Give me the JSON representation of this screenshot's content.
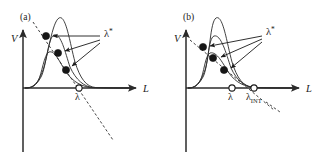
{
  "figure": {
    "background": "#ffffff",
    "ink_color": "#2b2b2b",
    "width": 326,
    "height": 159
  },
  "panels": [
    {
      "id": "a",
      "label": "(a)",
      "axes": {
        "y_label": "V",
        "x_label": "L",
        "origin_x": 23,
        "origin_y": 88,
        "x_axis_end": 140,
        "y_axis_top": 28,
        "y_axis_bottom": 152
      },
      "curves": [
        {
          "name": "curve-tall",
          "peak_x": 59,
          "peak_y": 18,
          "width": 17
        },
        {
          "name": "curve-medium",
          "peak_x": 53,
          "peak_y": 35,
          "width": 20
        },
        {
          "name": "curve-short",
          "peak_x": 48,
          "peak_y": 52,
          "width": 24
        }
      ],
      "critical_points": [
        {
          "name": "lambda-star-1",
          "x": 46,
          "y": 36,
          "type": "filled"
        },
        {
          "name": "lambda-star-2",
          "x": 58,
          "y": 53,
          "type": "filled"
        },
        {
          "name": "lambda-star-3",
          "x": 66,
          "y": 70,
          "type": "filled"
        }
      ],
      "axis_points": [
        {
          "name": "lambda",
          "label": "λ",
          "x": 79,
          "y": 88,
          "type": "open"
        }
      ],
      "dashed_line": {
        "name": "locus-line",
        "x1": 33,
        "y1": 22,
        "x2": 113,
        "y2": 140
      },
      "annotation": {
        "name": "lambda-star-annotation",
        "text": "λ",
        "superscript": "*",
        "x": 106,
        "y": 36,
        "arrows": [
          {
            "x1": 100,
            "y1": 36,
            "x2": 52,
            "y2": 36
          },
          {
            "x1": 100,
            "y1": 39,
            "x2": 64,
            "y2": 52
          },
          {
            "x1": 100,
            "y1": 41,
            "x2": 71,
            "y2": 67
          }
        ]
      }
    },
    {
      "id": "b",
      "label": "(b)",
      "axes": {
        "y_label": "V",
        "x_label": "L",
        "origin_x": 186,
        "origin_y": 88,
        "x_axis_end": 303,
        "y_axis_top": 28,
        "y_axis_bottom": 152
      },
      "curves": [
        {
          "name": "curve-tall",
          "peak_x": 216,
          "peak_y": 18,
          "width": 16
        },
        {
          "name": "curve-medium",
          "peak_x": 213,
          "peak_y": 36,
          "width": 20
        },
        {
          "name": "curve-short",
          "peak_x": 210,
          "peak_y": 53,
          "width": 24
        }
      ],
      "critical_points": [
        {
          "name": "lambda-star-1",
          "x": 203,
          "y": 47,
          "type": "filled"
        },
        {
          "name": "lambda-star-2",
          "x": 213,
          "y": 58,
          "type": "filled"
        },
        {
          "name": "lambda-star-3",
          "x": 224,
          "y": 70,
          "type": "filled"
        }
      ],
      "axis_points": [
        {
          "name": "lambda",
          "label": "λ",
          "x": 232,
          "y": 88,
          "type": "open"
        },
        {
          "name": "lambda-int",
          "label": "λ",
          "subscript": "INT",
          "x": 254,
          "y": 88,
          "type": "open"
        }
      ],
      "dashed_line": {
        "name": "locus-line",
        "x1": 190,
        "y1": 40,
        "x2": 272,
        "y2": 108
      },
      "annotation": {
        "name": "lambda-star-annotation",
        "text": "λ",
        "superscript": "*",
        "x": 268,
        "y": 34,
        "arrows": [
          {
            "x1": 262,
            "y1": 36,
            "x2": 209,
            "y2": 46
          },
          {
            "x1": 262,
            "y1": 39,
            "x2": 220,
            "y2": 57
          },
          {
            "x1": 262,
            "y1": 41,
            "x2": 230,
            "y2": 68
          }
        ]
      }
    }
  ]
}
